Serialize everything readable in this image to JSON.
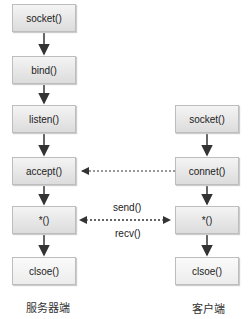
{
  "server": {
    "caption": "服务器端",
    "steps": [
      "socket()",
      "bind()",
      "listen()",
      "accept()",
      "*()",
      "clsoe()"
    ]
  },
  "client": {
    "caption": "客户端",
    "steps": [
      "socket()",
      "connet()",
      "*()",
      "clsoe()"
    ]
  },
  "links": {
    "send": "send()",
    "recv": "recv()"
  }
}
